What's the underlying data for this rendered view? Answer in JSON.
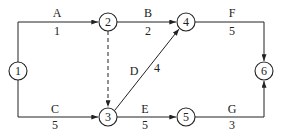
{
  "diagram": {
    "type": "activity-on-arrow network",
    "nodes": [
      {
        "id": "1",
        "label": "1",
        "x": 18,
        "y": 71
      },
      {
        "id": "2",
        "label": "2",
        "x": 108,
        "y": 22
      },
      {
        "id": "3",
        "label": "3",
        "x": 108,
        "y": 117
      },
      {
        "id": "4",
        "label": "4",
        "x": 186,
        "y": 22
      },
      {
        "id": "5",
        "label": "5",
        "x": 186,
        "y": 117
      },
      {
        "id": "6",
        "label": "6",
        "x": 264,
        "y": 71
      }
    ],
    "activities": [
      {
        "name": "A",
        "duration": "1",
        "from": "1",
        "to": "2"
      },
      {
        "name": "B",
        "duration": "2",
        "from": "2",
        "to": "4"
      },
      {
        "name": "C",
        "duration": "5",
        "from": "1",
        "to": "3"
      },
      {
        "name": "D",
        "duration": "4",
        "from": "3",
        "to": "4"
      },
      {
        "name": "E",
        "duration": "5",
        "from": "3",
        "to": "5"
      },
      {
        "name": "F",
        "duration": "5",
        "from": "4",
        "to": "6"
      },
      {
        "name": "G",
        "duration": "3",
        "from": "5",
        "to": "6"
      },
      {
        "name": "dummy",
        "duration": "",
        "from": "2",
        "to": "3",
        "style": "dashed"
      }
    ]
  }
}
